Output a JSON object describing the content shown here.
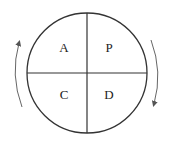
{
  "diagram": {
    "quadrants": [
      {
        "position": "top-left",
        "label": "A"
      },
      {
        "position": "top-right",
        "label": "P"
      },
      {
        "position": "bottom-left",
        "label": "C"
      },
      {
        "position": "bottom-right",
        "label": "D"
      }
    ],
    "arrows": [
      {
        "side": "left",
        "direction": "up"
      },
      {
        "side": "right",
        "direction": "down"
      }
    ],
    "colors": {
      "stroke": "#333333",
      "arrow": "#666666",
      "background": "#ffffff"
    }
  }
}
